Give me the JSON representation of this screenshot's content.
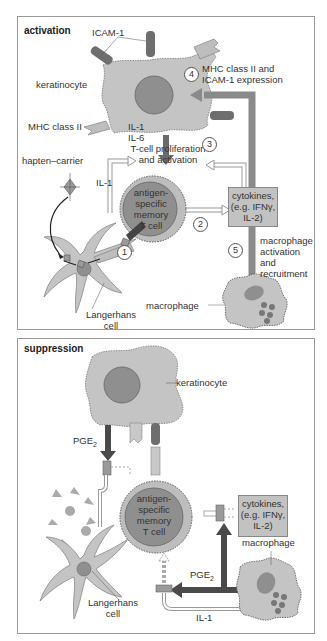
{
  "activation": {
    "title": "activation",
    "labels": {
      "icam": "ICAM-1",
      "keratinocyte": "keratinocyte",
      "mhc": "MHC class II",
      "il1_il6_a": "IL-1",
      "il1_il6_b": "IL-6",
      "hapten": "hapten–carrier",
      "il1": "IL-1",
      "tcell_prolif_1": "T-cell proliferation",
      "tcell_prolif_2": "and activation",
      "tcell_1": "antigen-",
      "tcell_2": "specific",
      "tcell_3": "memory",
      "tcell_4": "T cell",
      "cytokines_1": "cytokines,",
      "cytokines_2": "(e.g. IFNγ,",
      "cytokines_3": "IL-2)",
      "mhc_expr_1": "MHC class II and",
      "mhc_expr_2": "ICAM-1 expression",
      "mac_act_1": "macrophage",
      "mac_act_2": "activation",
      "mac_act_3": "and",
      "mac_act_4": "recruitment",
      "langerhans_1": "Langerhans",
      "langerhans_2": "cell",
      "macrophage": "macrophage"
    },
    "steps": [
      "1",
      "2",
      "3",
      "4",
      "5"
    ]
  },
  "suppression": {
    "title": "suppression",
    "labels": {
      "keratinocyte": "keratinocyte",
      "pge2_top": "PGE",
      "pge2_sub": "2",
      "tcell_1": "antigen-",
      "tcell_2": "specific",
      "tcell_3": "memory",
      "tcell_4": "T cell",
      "cytokines_1": "cytokines,",
      "cytokines_2": "(e.g. IFNγ,",
      "cytokines_3": "IL-2)",
      "macrophage": "macrophage",
      "pge2_mac": "PGE",
      "pge2_mac_sub": "2",
      "il1": "IL-1",
      "langerhans_1": "Langerhans",
      "langerhans_2": "cell"
    }
  },
  "colors": {
    "cell_fill": "#c4c4c4",
    "nucleus": "#8f8f8f",
    "receptor_dark": "#6e6e6e",
    "arrow_dark": "#5a5a5a",
    "arrow_gray": "#8a8a8a",
    "border": "#9a9a9a"
  }
}
